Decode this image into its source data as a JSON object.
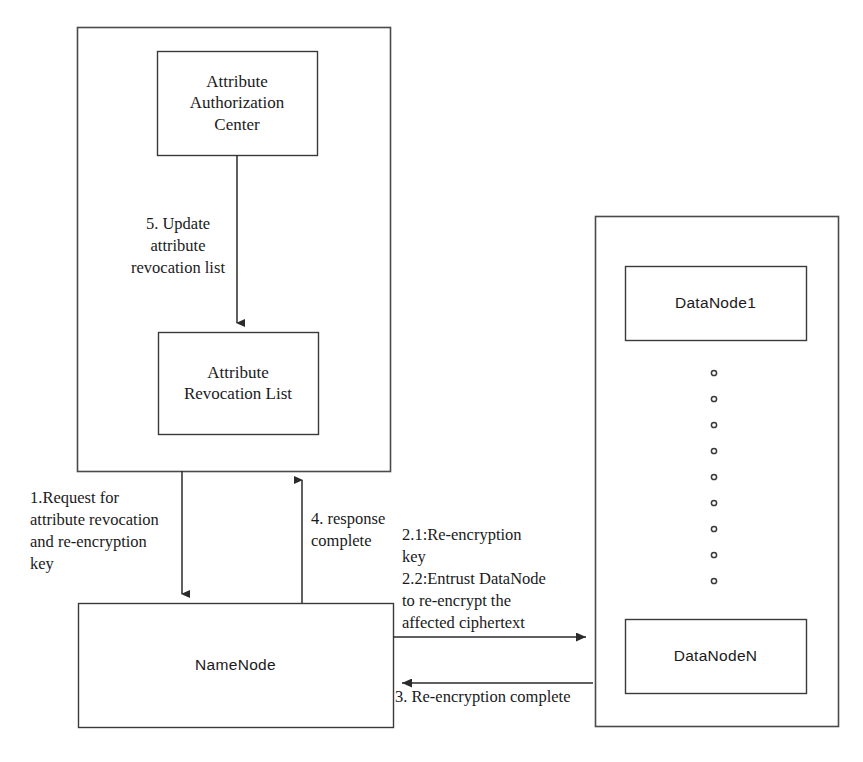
{
  "diagram": {
    "background_color": "#ffffff",
    "line_color": "#2b2b2b",
    "text_color": "#1a1a1a",
    "containers": [
      {
        "id": "trusted-authority-container",
        "name": "left-container",
        "x": 77,
        "y": 27,
        "width": 313,
        "height": 444
      },
      {
        "id": "datanode-cluster-container",
        "name": "right-container",
        "x": 595,
        "y": 216,
        "width": 243,
        "height": 510
      }
    ],
    "nodes": [
      {
        "id": "attribute-authorization-center",
        "label": "Attribute\nAuthorization\nCenter",
        "font": "serif",
        "x": 157,
        "y": 51,
        "width": 160,
        "height": 104
      },
      {
        "id": "attribute-revocation-list",
        "label": "Attribute\nRevocation List",
        "font": "serif",
        "x": 158,
        "y": 332,
        "width": 160,
        "height": 102
      },
      {
        "id": "namenode",
        "label": "NameNode",
        "font": "sans",
        "x": 78,
        "y": 603,
        "width": 315,
        "height": 124
      },
      {
        "id": "datanode-1",
        "label": "DataNode1",
        "font": "sans",
        "x": 625,
        "y": 266,
        "width": 181,
        "height": 74
      },
      {
        "id": "datanode-n",
        "label": "DataNodeN",
        "font": "sans",
        "x": 625,
        "y": 619,
        "width": 181,
        "height": 74
      }
    ],
    "ellipsis_dots": {
      "id": "datanode-ellipsis",
      "count": 9,
      "x": 714,
      "y_start": 373,
      "y_step": 26,
      "radius": 2.6
    },
    "edges": [
      {
        "id": "edge-update-revocation-list",
        "from": "attribute-authorization-center",
        "to": "attribute-revocation-list",
        "direction": "down",
        "x": 237,
        "y1": 155,
        "y2": 330
      },
      {
        "id": "edge-request-revocation",
        "from": "left-container",
        "to": "namenode",
        "direction": "down",
        "x": 182,
        "y1": 471,
        "y2": 601
      },
      {
        "id": "edge-response-complete",
        "from": "namenode",
        "to": "left-container",
        "direction": "up",
        "x": 302,
        "y1": 603,
        "y2": 473
      },
      {
        "id": "edge-entrust-datanode",
        "from": "namenode",
        "to": "datanode-cluster-container",
        "direction": "right",
        "y": 637,
        "x1": 393,
        "x2": 593
      },
      {
        "id": "edge-reencryption-complete",
        "from": "datanode-cluster-container",
        "to": "namenode",
        "direction": "left",
        "y": 683,
        "x1": 593,
        "x2": 395
      }
    ],
    "edge_labels": [
      {
        "id": "label-5-update",
        "for_edge": "edge-update-revocation-list",
        "text": "5. Update\nattribute\nrevocation list",
        "x": 113,
        "y": 213,
        "width": 130,
        "align": "center"
      },
      {
        "id": "label-1-request",
        "for_edge": "edge-request-revocation",
        "text": "1.Request for\nattribute revocation\nand re-encryption\nkey",
        "x": 30,
        "y": 487,
        "width": 150,
        "align": "left"
      },
      {
        "id": "label-4-response",
        "for_edge": "edge-response-complete",
        "text": "4. response\ncomplete",
        "x": 311,
        "y": 508,
        "width": 110,
        "align": "left"
      },
      {
        "id": "label-2-entrust",
        "for_edge": "edge-entrust-datanode",
        "text": "2.1:Re-encryption\nkey\n2.2:Entrust DataNode\nto re-encrypt the\naffected ciphertext",
        "x": 402,
        "y": 524,
        "width": 190,
        "align": "left"
      },
      {
        "id": "label-3-complete",
        "for_edge": "edge-reencryption-complete",
        "text": "3. Re-encryption complete",
        "x": 395,
        "y": 686,
        "width": 220,
        "align": "left"
      }
    ]
  }
}
